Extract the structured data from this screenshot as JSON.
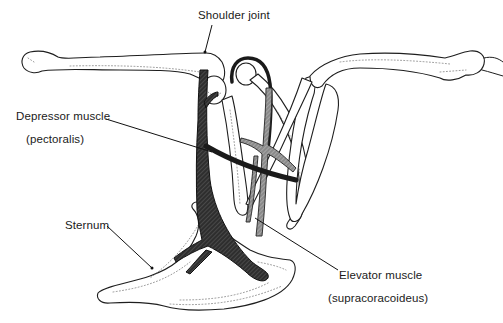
{
  "diagram": {
    "type": "anatomical line drawing",
    "colors": {
      "background": "#ffffff",
      "line": "#1e1e1e",
      "muscle_fill": "#3a3a3a",
      "label_text": "#1a1a1a"
    },
    "labels": {
      "shoulder_joint": "Shoulder joint",
      "depressor_muscle": "Depressor muscle",
      "depressor_muscle_sub": "(pectoralis)",
      "sternum": "Sternum",
      "elevator_muscle": "Elevator muscle",
      "elevator_muscle_sub": "(supracoracoideus)"
    }
  }
}
